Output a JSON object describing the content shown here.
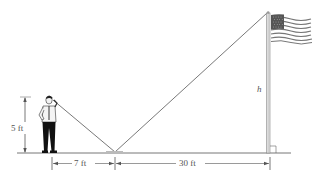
{
  "diagram": {
    "type": "similar-triangles mirror problem",
    "labels": {
      "person_height": "5 ft",
      "person_to_mirror": "7 ft",
      "mirror_to_pole": "30 ft",
      "pole_height": "h"
    },
    "elements": [
      "person",
      "mirror",
      "flagpole",
      "flag",
      "ground",
      "sight-lines",
      "right-angle-marker"
    ],
    "colors": {
      "line": "#555555",
      "pole": "#9a9a9a",
      "person_pants": "#111111",
      "flag_stripes": "#7a7a7a"
    }
  }
}
